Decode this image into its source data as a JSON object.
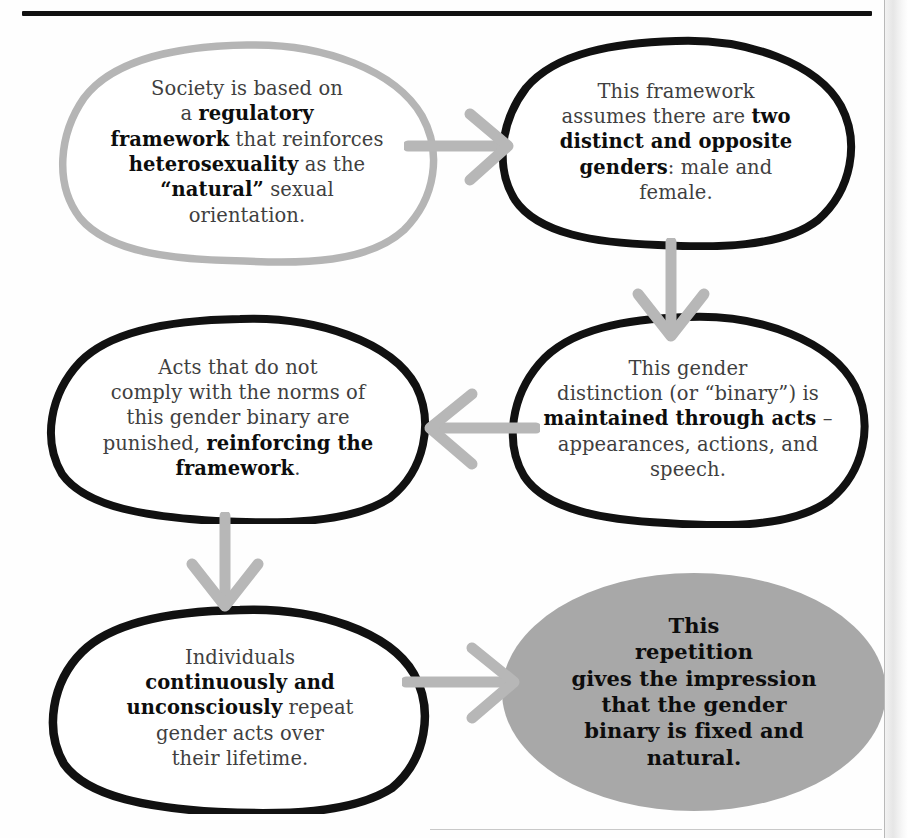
{
  "page": {
    "colors": {
      "ink_black": "#111111",
      "stroke_gray": "#b5b5b5",
      "arrow_gray": "#b7b7b7",
      "fill_gray": "#a8a8a8",
      "body_text": "#3f3f3f",
      "bold_text": "#0d0d0d"
    }
  },
  "nodes": [
    {
      "id": "node-1",
      "outline": "gray",
      "fill": "none",
      "lines": [
        {
          "runs": [
            {
              "t": "Society is based on",
              "b": false
            }
          ]
        },
        {
          "runs": [
            {
              "t": "a ",
              "b": false
            },
            {
              "t": "regulatory",
              "b": true
            }
          ]
        },
        {
          "runs": [
            {
              "t": "framework",
              "b": true
            },
            {
              "t": " that reinforces",
              "b": false
            }
          ]
        },
        {
          "runs": [
            {
              "t": "heterosexuality",
              "b": true
            },
            {
              "t": " as the",
              "b": false
            }
          ]
        },
        {
          "runs": [
            {
              "t": "“natural”",
              "b": true
            },
            {
              "t": " sexual",
              "b": false
            }
          ]
        },
        {
          "runs": [
            {
              "t": "orientation.",
              "b": false
            }
          ]
        }
      ],
      "plain": "Society is based on a regulatory framework that reinforces heterosexuality as the “natural” sexual orientation."
    },
    {
      "id": "node-2",
      "outline": "black",
      "fill": "none",
      "lines": [
        {
          "runs": [
            {
              "t": "This framework",
              "b": false
            }
          ]
        },
        {
          "runs": [
            {
              "t": "assumes there are ",
              "b": false
            },
            {
              "t": "two",
              "b": true
            }
          ]
        },
        {
          "runs": [
            {
              "t": "distinct and opposite",
              "b": true
            }
          ]
        },
        {
          "runs": [
            {
              "t": "genders",
              "b": true
            },
            {
              "t": ": male and",
              "b": false
            }
          ]
        },
        {
          "runs": [
            {
              "t": "female.",
              "b": false
            }
          ]
        }
      ],
      "plain": "This framework assumes there are two distinct and opposite genders: male and female."
    },
    {
      "id": "node-3",
      "outline": "black",
      "fill": "none",
      "lines": [
        {
          "runs": [
            {
              "t": "This gender",
              "b": false
            }
          ]
        },
        {
          "runs": [
            {
              "t": "distinction (or “binary”) is",
              "b": false
            }
          ]
        },
        {
          "runs": [
            {
              "t": "maintained through acts",
              "b": true
            },
            {
              "t": " –",
              "b": false
            }
          ]
        },
        {
          "runs": [
            {
              "t": "appearances, actions, and",
              "b": false
            }
          ]
        },
        {
          "runs": [
            {
              "t": "speech.",
              "b": false
            }
          ]
        }
      ],
      "plain": "This gender distinction (or “binary”) is maintained through acts – appearances, actions, and speech."
    },
    {
      "id": "node-4",
      "outline": "black",
      "fill": "none",
      "lines": [
        {
          "runs": [
            {
              "t": "Acts that do not",
              "b": false
            }
          ]
        },
        {
          "runs": [
            {
              "t": "comply with the norms of",
              "b": false
            }
          ]
        },
        {
          "runs": [
            {
              "t": "this gender binary are",
              "b": false
            }
          ]
        },
        {
          "runs": [
            {
              "t": "punished, ",
              "b": false
            },
            {
              "t": "reinforcing the",
              "b": true
            }
          ]
        },
        {
          "runs": [
            {
              "t": "framework",
              "b": true
            },
            {
              "t": ".",
              "b": false
            }
          ]
        }
      ],
      "plain": "Acts that do not comply with the norms of this gender binary are punished, reinforcing the framework."
    },
    {
      "id": "node-5",
      "outline": "black",
      "fill": "none",
      "lines": [
        {
          "runs": [
            {
              "t": "Individuals",
              "b": false
            }
          ]
        },
        {
          "runs": [
            {
              "t": "continuously and",
              "b": true
            }
          ]
        },
        {
          "runs": [
            {
              "t": "unconsciously",
              "b": true
            },
            {
              "t": " repeat",
              "b": false
            }
          ]
        },
        {
          "runs": [
            {
              "t": "gender acts over",
              "b": false
            }
          ]
        },
        {
          "runs": [
            {
              "t": "their lifetime.",
              "b": false
            }
          ]
        }
      ],
      "plain": "Individuals continuously and unconsciously repeat gender acts over their lifetime."
    },
    {
      "id": "node-6",
      "outline": "none",
      "fill": "gray",
      "lines": [
        {
          "runs": [
            {
              "t": "This",
              "b": true
            }
          ]
        },
        {
          "runs": [
            {
              "t": "repetition",
              "b": true
            }
          ]
        },
        {
          "runs": [
            {
              "t": "gives the impression",
              "b": true
            }
          ]
        },
        {
          "runs": [
            {
              "t": "that the gender",
              "b": true
            }
          ]
        },
        {
          "runs": [
            {
              "t": "binary is fixed and",
              "b": true
            }
          ]
        },
        {
          "runs": [
            {
              "t": "natural.",
              "b": true
            }
          ]
        }
      ],
      "plain": "This repetition gives the impression that the gender binary is fixed and natural."
    }
  ],
  "arrows": [
    {
      "id": "arrow-1",
      "from": "node-1",
      "to": "node-2",
      "direction": "right",
      "color": "#b7b7b7"
    },
    {
      "id": "arrow-2",
      "from": "node-2",
      "to": "node-3",
      "direction": "down",
      "color": "#b7b7b7"
    },
    {
      "id": "arrow-3",
      "from": "node-3",
      "to": "node-4",
      "direction": "left",
      "color": "#b7b7b7"
    },
    {
      "id": "arrow-4",
      "from": "node-4",
      "to": "node-5",
      "direction": "down",
      "color": "#b7b7b7"
    },
    {
      "id": "arrow-5",
      "from": "node-5",
      "to": "node-6",
      "direction": "right",
      "color": "#b7b7b7"
    }
  ]
}
